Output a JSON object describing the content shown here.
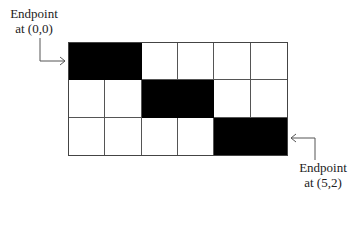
{
  "grid": {
    "columns": 6,
    "rows": 3,
    "filled_cells": [
      {
        "row": 0,
        "col": 0
      },
      {
        "row": 0,
        "col": 1
      },
      {
        "row": 1,
        "col": 2
      },
      {
        "row": 1,
        "col": 3
      },
      {
        "row": 2,
        "col": 4
      },
      {
        "row": 2,
        "col": 5
      }
    ]
  },
  "labels": {
    "start": {
      "line1": "Endpoint",
      "line2": "at (0,0)"
    },
    "end": {
      "line1": "Endpoint",
      "line2": "at (5,2)"
    }
  },
  "colors": {
    "filled": "#000000",
    "empty": "#ffffff",
    "line": "#555555"
  }
}
